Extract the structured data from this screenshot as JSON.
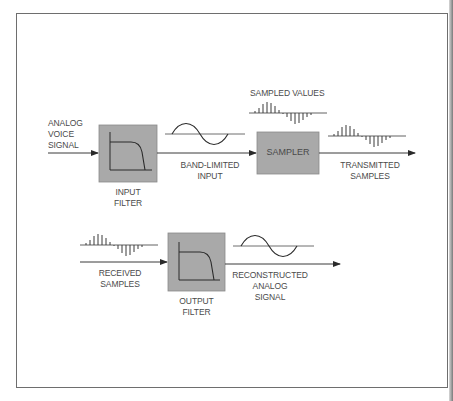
{
  "diagram": {
    "labels": {
      "analog_voice_signal": "ANALOG\nVOICE\nSIGNAL",
      "input_filter": "INPUT\nFILTER",
      "band_limited_input": "BAND-LIMITED\nINPUT",
      "sampled_values": "SAMPLED VALUES",
      "sampler": "SAMPLER",
      "transmitted_samples": "TRANSMITTED\nSAMPLES",
      "received_samples": "RECEIVED\nSAMPLES",
      "output_filter": "OUTPUT\nFILTER",
      "reconstructed_analog_signal": "RECONSTRUCTED\nANALOG\nSIGNAL"
    },
    "colors": {
      "block_fill": "#a9a9a9",
      "line": "#3a3a3a",
      "text": "#4a4a4a",
      "frame": "#6e6e6e"
    },
    "blocks": [
      "INPUT FILTER",
      "SAMPLER",
      "OUTPUT FILTER"
    ],
    "flow_top": [
      "ANALOG VOICE SIGNAL",
      "INPUT FILTER",
      "BAND-LIMITED INPUT",
      "SAMPLER",
      "TRANSMITTED SAMPLES"
    ],
    "flow_bottom": [
      "RECEIVED SAMPLES",
      "OUTPUT FILTER",
      "RECONSTRUCTED ANALOG SIGNAL"
    ]
  }
}
